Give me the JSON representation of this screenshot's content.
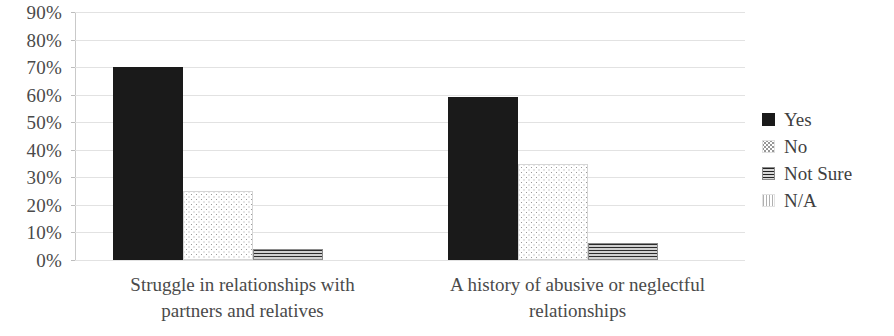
{
  "chart_data": {
    "type": "bar",
    "title": "",
    "subtitle": "",
    "xlabel": "",
    "ylabel": "",
    "ylim": [
      0,
      90
    ],
    "ytick_step": 10,
    "ytick_labels": [
      "90%",
      "80%",
      "70%",
      "60%",
      "50%",
      "40%",
      "30%",
      "20%",
      "10%",
      "0%"
    ],
    "ytick_values": [
      90,
      80,
      70,
      60,
      50,
      40,
      30,
      20,
      10,
      0
    ],
    "value_unit": "%",
    "grid": true,
    "grid_axis": "y",
    "legend_position": "right",
    "categories": [
      "Struggle in relationships with partners and relatives",
      "A history of abusive or neglectful relationships"
    ],
    "category_lines": [
      [
        "Struggle in relationships with",
        "partners and relatives"
      ],
      [
        "A history of abusive or neglectful",
        "relationships"
      ]
    ],
    "series": [
      {
        "name": "Yes",
        "pattern": "solid-black",
        "color": "#1a1a1a",
        "values": [
          70,
          59
        ]
      },
      {
        "name": "No",
        "pattern": "fine-dots",
        "color": "#9a9a9a",
        "values": [
          25,
          35
        ]
      },
      {
        "name": "Not Sure",
        "pattern": "horizontal-stripes",
        "color": "#8d8d8d",
        "values": [
          4,
          6
        ]
      },
      {
        "name": "N/A",
        "pattern": "vertical-dots",
        "color": "#b5b5b5",
        "values": [
          0,
          0
        ]
      }
    ]
  },
  "legend": {
    "items": [
      {
        "label": "Yes",
        "swatch": "solid-black-swatch"
      },
      {
        "label": "No",
        "swatch": "fine-dots-swatch"
      },
      {
        "label": "Not Sure",
        "swatch": "horizontal-stripes-swatch"
      },
      {
        "label": "N/A",
        "swatch": "vertical-dots-swatch"
      }
    ]
  }
}
